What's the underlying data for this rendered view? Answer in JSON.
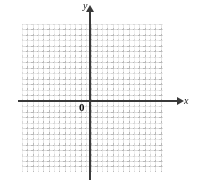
{
  "figure": {
    "kind": "cartesian-coordinate-grid",
    "background_color": "#ffffff",
    "axis_color": "#3a3a3a",
    "grid_major_color": "#d8d8d8",
    "grid_minor_color": "#b9b9b9",
    "labels": {
      "x_axis": "x",
      "y_axis": "y",
      "origin": "0"
    }
  },
  "chart_data": {
    "type": "scatter",
    "title": "",
    "subtitle": "",
    "xlabel": "x",
    "ylabel": "y",
    "origin_label": "0",
    "series": [],
    "x": [],
    "values": [],
    "categories": [],
    "xlim": [
      -4.25,
      4.5
    ],
    "ylim": [
      -4.25,
      4.75
    ],
    "xticks": [],
    "yticks": [],
    "xticklabels": [],
    "yticklabels": [],
    "grid": true,
    "grid_style": "dotted-minor-with-solid-major",
    "grid_major_step": 1,
    "grid_minor_per_major": 3,
    "legend": null,
    "legend_position": "none",
    "annotations": []
  }
}
